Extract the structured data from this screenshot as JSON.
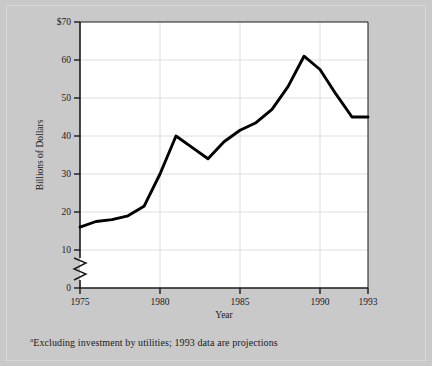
{
  "figure": {
    "background_color": "#c9c9c9",
    "plot_background_color": "#ffffff",
    "line_color": "#000000",
    "grid_color": "#d5d5d5",
    "axis_color": "#1a1a1a"
  },
  "footnote": {
    "marker": "a",
    "text": "Excluding investment by utilities; 1993 data are projections"
  },
  "chart_data": {
    "type": "line",
    "title": "",
    "xlabel": "Year",
    "ylabel": "Billions of Dollars",
    "xlim": [
      1975,
      1993
    ],
    "ylim": [
      0,
      70
    ],
    "y_axis_break": true,
    "y_axis_break_range": [
      0,
      10
    ],
    "grid": true,
    "grid_axis": "both",
    "legend": "none",
    "xticks": [
      1975,
      1980,
      1985,
      1990,
      1993
    ],
    "xtick_labels": [
      "1975",
      "1980",
      "1985",
      "1990",
      "1993"
    ],
    "yticks": [
      0,
      10,
      20,
      30,
      40,
      50,
      60,
      70
    ],
    "ytick_labels": [
      "0",
      "10",
      "20",
      "30",
      "40",
      "50",
      "60",
      "$70"
    ],
    "x": [
      1975,
      1976,
      1977,
      1978,
      1979,
      1980,
      1981,
      1982,
      1983,
      1984,
      1985,
      1986,
      1987,
      1988,
      1989,
      1990,
      1991,
      1992,
      1993
    ],
    "values": [
      16,
      17.5,
      18,
      19,
      21.5,
      30,
      40,
      37,
      34,
      38.5,
      41.5,
      43.5,
      47,
      53,
      61,
      57.5,
      51,
      45,
      45
    ],
    "series": [
      {
        "name": "Investment",
        "values": [
          16,
          17.5,
          18,
          19,
          21.5,
          30,
          40,
          37,
          34,
          38.5,
          41.5,
          43.5,
          47,
          53,
          61,
          57.5,
          51,
          45,
          45
        ]
      }
    ]
  }
}
